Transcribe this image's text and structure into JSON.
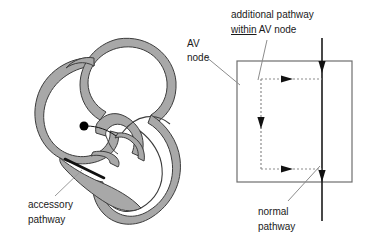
{
  "figure": {
    "background_color": "#ffffff",
    "wall_fill_color": "#a8a8a8",
    "outline_color": "#3c3c3c",
    "line_color": "#1a1a1a",
    "leader_color": "#9a9a9a"
  },
  "labels": {
    "accessory_pathway_line1": "accessory",
    "accessory_pathway_line2": "pathway",
    "av_node_line1": "AV",
    "av_node_line2": "node",
    "additional_pathway_line1_a": "additional pathway",
    "additional_pathway_line2_underlined": "within",
    "additional_pathway_line2_rest": " AV node",
    "normal_pathway_line1": "normal",
    "normal_pathway_line2": "pathway"
  },
  "heart_diagram": {
    "name": "heart-cross-section",
    "focus_dot": {
      "name": "accessory-pathway-origin-dot",
      "cx": 84,
      "cy": 126,
      "r": 4.5,
      "color": "#000000"
    },
    "accessory_pathway_stroke": {
      "name": "accessory-pathway-bundle",
      "x1": 65,
      "y1": 159,
      "x2": 104,
      "y2": 178
    }
  },
  "schematic": {
    "name": "av-node-schematic",
    "box": {
      "x": 237,
      "y": 61,
      "width": 115,
      "height": 121,
      "stroke": "#6e6e6e"
    },
    "normal_pathway_line": {
      "x": 322,
      "y_top": 38,
      "y_bottom": 221,
      "stroke": "#1a1a1a"
    },
    "normal_pathway_arrowheads_y": [
      68,
      177
    ],
    "additional_pathway": {
      "vertical_x": 261,
      "vertical_y_top": 79,
      "vertical_y_bottom": 169,
      "top_arrow_y": 79,
      "bottom_arrow_y": 169,
      "arrow_x_end": 322,
      "down_arrowhead_y": 126,
      "stroke": "#8c8c8c",
      "dash": "2,2"
    }
  }
}
